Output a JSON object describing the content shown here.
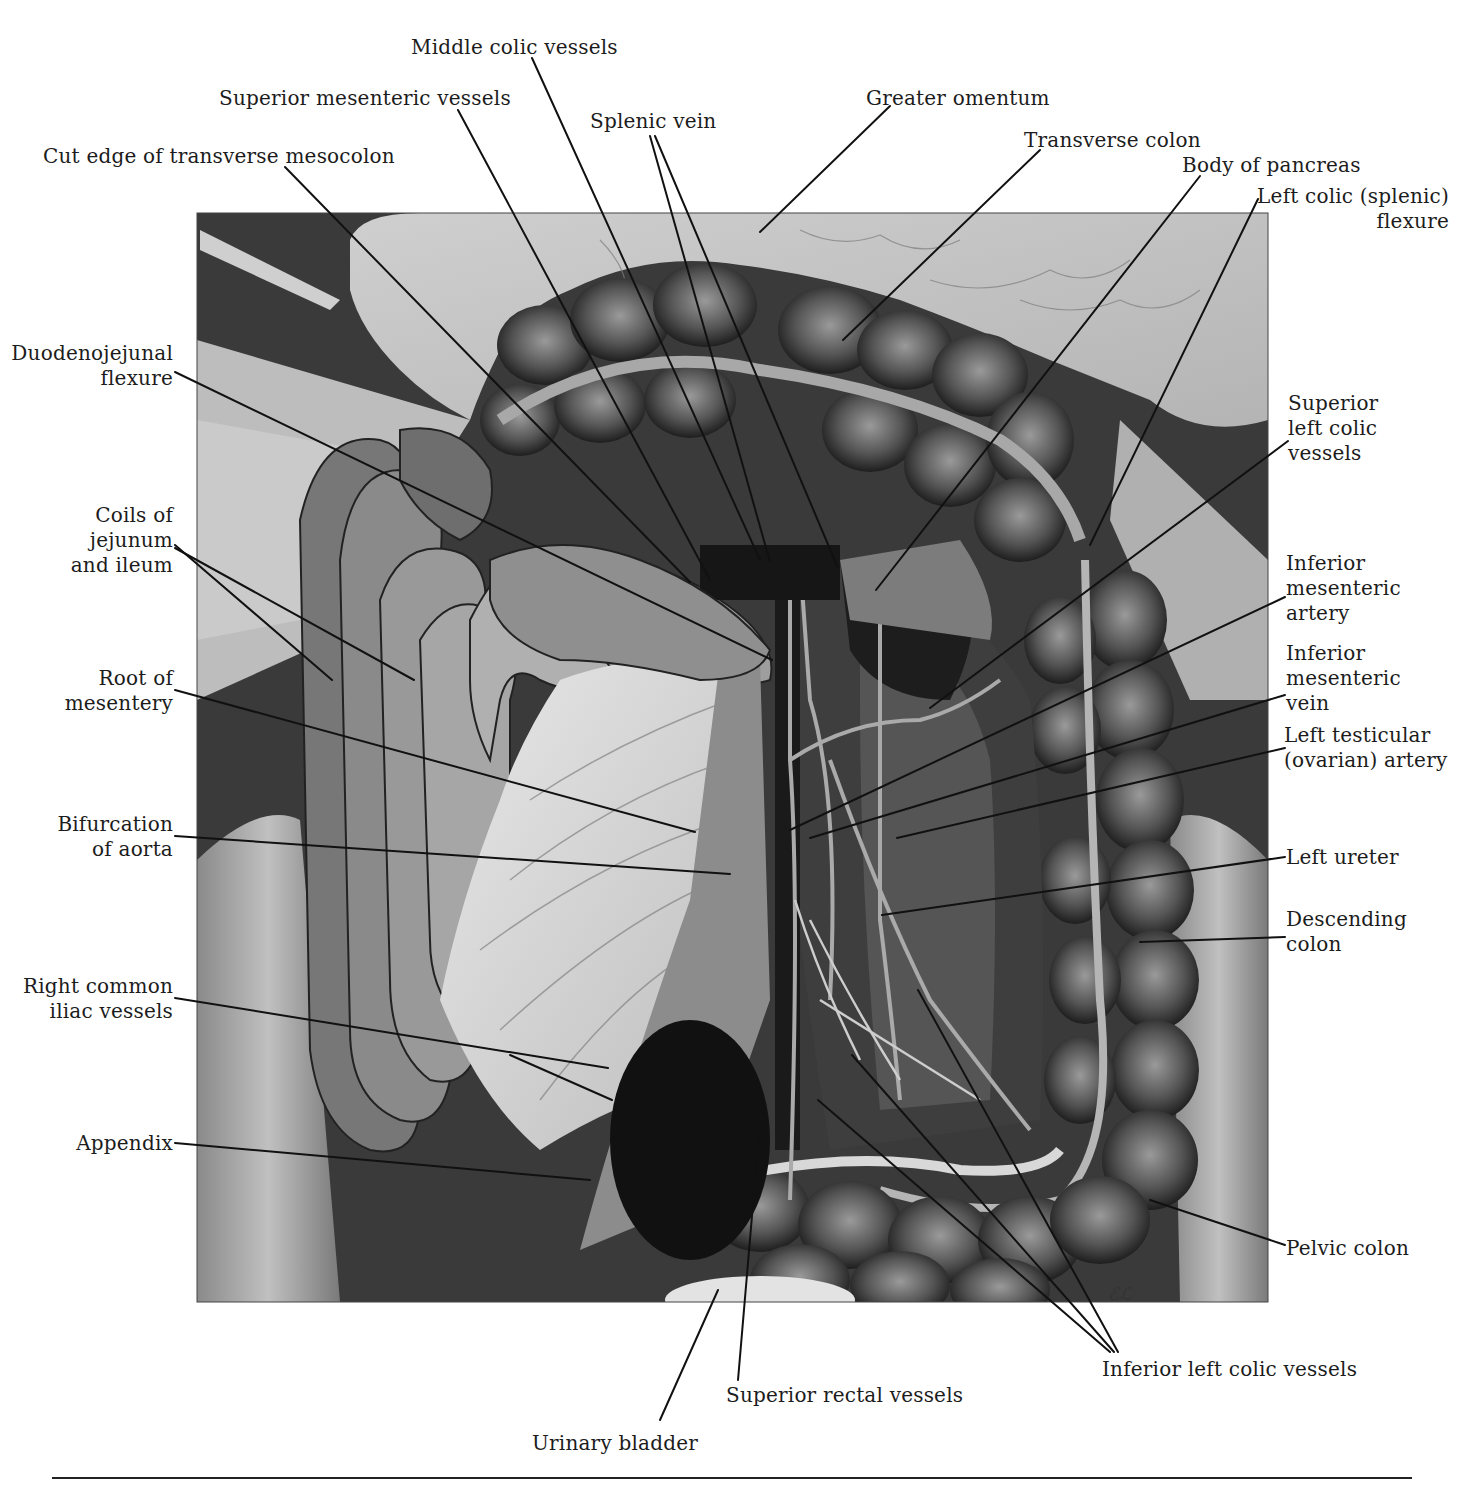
{
  "figure": {
    "colors": {
      "background": "#ffffff",
      "ink": "#1c1c1c",
      "tissue_light": "#c9c9c9",
      "tissue_mid": "#7a7a7a",
      "tissue_dark": "#2a2a2a"
    }
  },
  "labels": {
    "top": [
      {
        "id": "middle-colic-vessels",
        "text": "Middle colic vessels"
      },
      {
        "id": "superior-mesenteric-vessels",
        "text": "Superior mesenteric vessels"
      },
      {
        "id": "splenic-vein",
        "text": "Splenic vein"
      },
      {
        "id": "greater-omentum",
        "text": "Greater omentum"
      },
      {
        "id": "cut-edge-transverse-mesocolon",
        "text": "Cut edge of transverse mesocolon"
      },
      {
        "id": "transverse-colon",
        "text": "Transverse colon"
      },
      {
        "id": "body-of-pancreas",
        "text": "Body of pancreas"
      },
      {
        "id": "left-colic-flexure",
        "text": "Left colic (splenic)\n flexure"
      }
    ],
    "left": [
      {
        "id": "duodenojejunal-flexure",
        "text": "Duodenojejunal\nflexure"
      },
      {
        "id": "coils-jejunum-ileum",
        "text": "Coils of\njejunum\nand ileum"
      },
      {
        "id": "root-of-mesentery",
        "text": "Root of\nmesentery"
      },
      {
        "id": "bifurcation-of-aorta",
        "text": "Bifurcation\nof aorta"
      },
      {
        "id": "right-common-iliac-vessels",
        "text": "Right common\niliac vessels"
      },
      {
        "id": "appendix",
        "text": "Appendix"
      }
    ],
    "right": [
      {
        "id": "superior-left-colic-vessels",
        "text": "Superior\nleft colic\nvessels"
      },
      {
        "id": "inferior-mesenteric-artery",
        "text": "Inferior\nmesenteric\nartery"
      },
      {
        "id": "inferior-mesenteric-vein",
        "text": "Inferior\nmesenteric\nvein"
      },
      {
        "id": "left-testicular-artery",
        "text": "Left testicular\n(ovarian) artery"
      },
      {
        "id": "left-ureter",
        "text": "Left ureter"
      },
      {
        "id": "descending-colon",
        "text": "Descending\ncolon"
      },
      {
        "id": "pelvic-colon",
        "text": "Pelvic colon"
      }
    ],
    "bottom": [
      {
        "id": "inferior-left-colic-vessels",
        "text": "Inferior left colic vessels"
      },
      {
        "id": "superior-rectal-vessels",
        "text": "Superior rectal vessels"
      },
      {
        "id": "urinary-bladder",
        "text": "Urinary bladder"
      }
    ]
  },
  "artist_signature": "ℰℒ"
}
